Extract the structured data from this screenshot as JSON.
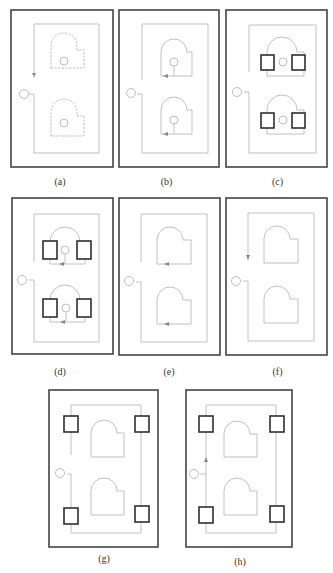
{
  "figure": {
    "panels": [
      {
        "id": "a",
        "label": "(a)",
        "elements": [
          "frame",
          "outer-loop-path",
          "port-circle",
          "down-arrow",
          "dashed-room-top",
          "dashed-room-bottom",
          "room-circles"
        ]
      },
      {
        "id": "b",
        "label": "(b)",
        "elements": [
          "frame",
          "outer-loop-path",
          "port-circle",
          "room-top",
          "room-bottom",
          "room-circles",
          "room-lead-lines",
          "left-arrows"
        ]
      },
      {
        "id": "c",
        "label": "(c)",
        "elements": [
          "frame",
          "outer-loop-path",
          "port-circle",
          "rooms",
          "room-circles",
          "square-blocks-4"
        ]
      },
      {
        "id": "d",
        "label": "(d)",
        "elements": [
          "frame",
          "outer-loop-path",
          "port-circle",
          "rooms",
          "room-circles",
          "square-blocks-4",
          "left-arrows"
        ]
      },
      {
        "id": "e",
        "label": "(e)",
        "elements": [
          "frame",
          "outer-loop-path",
          "port-circle",
          "rooms",
          "left-arrows"
        ]
      },
      {
        "id": "f",
        "label": "(f)",
        "elements": [
          "frame",
          "outer-loop-path",
          "port-circle",
          "rooms",
          "down-arrow"
        ]
      },
      {
        "id": "g",
        "label": "(g)",
        "elements": [
          "frame",
          "outer-loop-path",
          "port-circle",
          "rooms",
          "corner-squares-4"
        ]
      },
      {
        "id": "h",
        "label": "(h)",
        "elements": [
          "frame",
          "outer-loop-path",
          "port-circle",
          "rooms",
          "corner-squares-4",
          "up-arrow"
        ]
      }
    ]
  },
  "colors": {
    "frame": "#444444",
    "path": "#b9b9b9",
    "square": "#2f2f2f",
    "caption": "#333333"
  }
}
